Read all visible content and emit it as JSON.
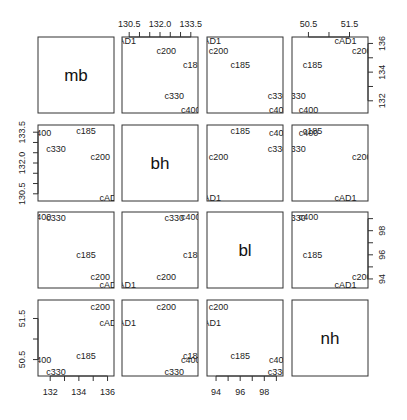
{
  "chart_data": {
    "type": "scatter",
    "subtype": "pairs-matrix",
    "title": "",
    "variables": [
      "mb",
      "bh",
      "bl",
      "nh"
    ],
    "point_labels": [
      "cAD1",
      "c200",
      "c185",
      "c330",
      "c400"
    ],
    "data": {
      "cAD1": {
        "mb": 136.2,
        "bh": 130.3,
        "bl": 93.5,
        "nh": 51.4
      },
      "c200": {
        "mb": 135.5,
        "bh": 132.3,
        "bl": 94.2,
        "nh": 51.8
      },
      "c185": {
        "mb": 134.5,
        "bh": 133.6,
        "bl": 96.0,
        "nh": 50.6
      },
      "c330": {
        "mb": 132.4,
        "bh": 132.7,
        "bl": 99.1,
        "nh": 50.2
      },
      "c400": {
        "mb": 131.4,
        "bh": 133.5,
        "bl": 99.2,
        "nh": 50.5
      }
    },
    "axis_ranges": {
      "mb": [
        131.15,
        136.45
      ],
      "bh": [
        130.15,
        133.85
      ],
      "bl": [
        93.25,
        99.55
      ],
      "nh": [
        50.1,
        51.95
      ]
    },
    "ticks": {
      "mb": {
        "values": [
          132,
          133,
          134,
          135,
          136
        ],
        "labels": [
          "132",
          "",
          "134",
          "",
          "136"
        ]
      },
      "bh": {
        "values": [
          130.5,
          131.0,
          131.5,
          132.0,
          132.5,
          133.0,
          133.5
        ],
        "labels": [
          "130.5",
          "",
          "",
          "132.0",
          "",
          "",
          "133.5"
        ]
      },
      "bl": {
        "values": [
          94,
          95,
          96,
          97,
          98,
          99
        ],
        "labels": [
          "94",
          "",
          "96",
          "",
          "98",
          ""
        ]
      },
      "nh": {
        "values": [
          50.5,
          51.0,
          51.5,
          52.0
        ],
        "labels": [
          "50.5",
          "",
          "51.5",
          ""
        ]
      }
    },
    "axis_placement": {
      "top": [
        "bh",
        "nh"
      ],
      "bottom": [
        "mb",
        "bl"
      ],
      "left": [
        "bh",
        "nh"
      ],
      "right": [
        "mb",
        "bl"
      ]
    },
    "grid": false,
    "legend": null
  }
}
